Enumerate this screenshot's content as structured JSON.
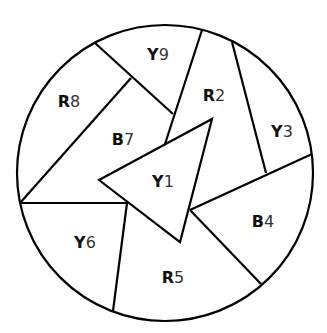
{
  "diagram": {
    "type": "map-coloring",
    "stroke_color": "#000000",
    "background_color": "#ffffff",
    "regions": [
      {
        "id": "Y1",
        "letter": "Y",
        "number": "1",
        "color_name": "yellow",
        "x": 163,
        "y": 181
      },
      {
        "id": "R2",
        "letter": "R",
        "number": "2",
        "color_name": "red",
        "x": 214,
        "y": 96
      },
      {
        "id": "Y3",
        "letter": "Y",
        "number": "3",
        "color_name": "yellow",
        "x": 282,
        "y": 132
      },
      {
        "id": "B4",
        "letter": "B",
        "number": "4",
        "color_name": "blue",
        "x": 263,
        "y": 222
      },
      {
        "id": "R5",
        "letter": "R",
        "number": "5",
        "color_name": "red",
        "x": 173,
        "y": 278
      },
      {
        "id": "Y6",
        "letter": "Y",
        "number": "6",
        "color_name": "yellow",
        "x": 85,
        "y": 243
      },
      {
        "id": "B7",
        "letter": "B",
        "number": "7",
        "color_name": "blue",
        "x": 123,
        "y": 140
      },
      {
        "id": "R8",
        "letter": "R",
        "number": "8",
        "color_name": "red",
        "x": 69,
        "y": 102
      },
      {
        "id": "Y9",
        "letter": "Y",
        "number": "9",
        "color_name": "yellow",
        "x": 158,
        "y": 55
      }
    ]
  }
}
